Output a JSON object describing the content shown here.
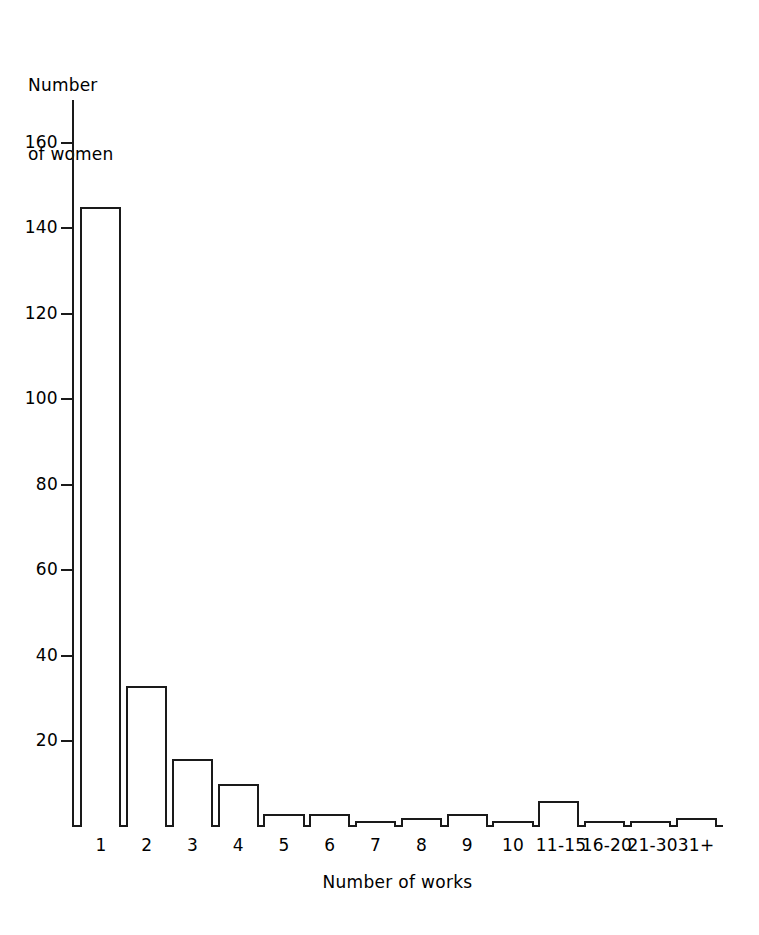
{
  "chart_data": {
    "type": "bar",
    "title": "",
    "subtitle": "",
    "xlabel": "Number of works",
    "ylabel": "Number\nof women",
    "categories": [
      "1",
      "2",
      "3",
      "4",
      "5",
      "6",
      "7",
      "8",
      "9",
      "10",
      "11-15",
      "16-20",
      "21-30",
      "31+"
    ],
    "values": [
      145,
      33,
      16,
      10,
      3,
      3,
      1,
      2,
      3,
      1,
      6,
      1,
      1,
      2
    ],
    "ylim": [
      0,
      170
    ],
    "xlim": [
      0,
      14
    ],
    "yticks": [
      20,
      40,
      60,
      80,
      100,
      120,
      140,
      160
    ],
    "ytick_labels": [
      "20",
      "40",
      "60",
      "80",
      "100",
      "120",
      "140",
      "160"
    ],
    "grid": false,
    "legend": null,
    "legend_position": "none",
    "bar_fill_color": "#ffffff",
    "bar_edge_color": "#1a1a1a",
    "background_color": "#ffffff",
    "axis_color": "#1a1a1a"
  },
  "axes": {
    "y_title_line1": "Number",
    "y_title_line2": "of women",
    "x_title": "Number of works"
  }
}
